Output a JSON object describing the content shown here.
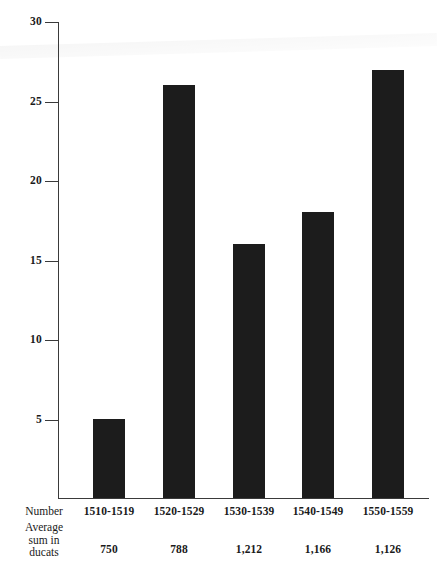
{
  "chart_data": {
    "type": "bar",
    "title": "",
    "subtitle": "",
    "xlabel": "",
    "ylabel": "",
    "categories": [
      "1510-1519",
      "1520-1529",
      "1530-1539",
      "1540-1549",
      "1550-1559"
    ],
    "values": [
      5,
      26,
      16,
      18,
      27
    ],
    "series": [
      {
        "name": "Number",
        "values": [
          5,
          26,
          16,
          18,
          27
        ]
      }
    ],
    "ylim": [
      0,
      30
    ],
    "yticks": [
      5,
      10,
      15,
      20,
      25,
      30
    ],
    "ytick_labels": [
      "5",
      "10",
      "15",
      "20",
      "25",
      "30"
    ],
    "grid": false,
    "legend": "none",
    "bar_color": "#1c1c1c",
    "axis_color": "#3a3a3a",
    "annotations": {
      "row_header_number": "Number",
      "row_header_average_lines": [
        "Average",
        "sum in",
        "ducats"
      ],
      "average_sum_in_ducats": [
        "750",
        "788",
        "1,212",
        "1,166",
        "1,126"
      ]
    }
  },
  "axis": {
    "ticks": [
      {
        "label": "30",
        "value": 30
      },
      {
        "label": "25",
        "value": 25
      },
      {
        "label": "20",
        "value": 20
      },
      {
        "label": "15",
        "value": 15
      },
      {
        "label": "10",
        "value": 10
      },
      {
        "label": "5",
        "value": 5
      }
    ]
  },
  "table": {
    "row_number_label": "Number",
    "row_average_line1": "Average",
    "row_average_line2": "sum in",
    "row_average_line3": "ducats",
    "periods": [
      "1510-1519",
      "1520-1529",
      "1530-1539",
      "1540-1549",
      "1550-1559"
    ],
    "averages": [
      "750",
      "788",
      "1,212",
      "1,166",
      "1,126"
    ]
  }
}
